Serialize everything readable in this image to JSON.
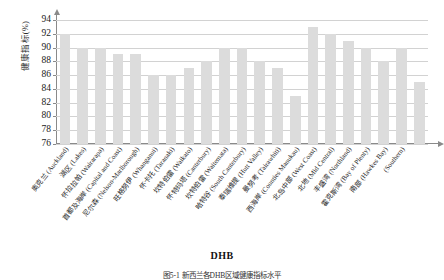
{
  "figure": {
    "axis_title_x": "DHB",
    "axis_title_y": "健康指标(%)",
    "caption": "图5-1  新西兰各DHB区域健康指标水平"
  },
  "chart_data": {
    "type": "bar",
    "title": "",
    "xlabel": "DHB",
    "ylabel": "健康指标(%)",
    "ylim": [
      76,
      94
    ],
    "ytick_step": 2,
    "ytick_labels": [
      "76",
      "78",
      "80",
      "82",
      "84",
      "86",
      "88",
      "90",
      "92",
      "94"
    ],
    "grid": true,
    "legend": "none",
    "bar_color": "#dcdcdc",
    "categories": [
      "奥克兰（Auckland）",
      "湖区（Lakes）",
      "怀拉拉帕（Wairarapa）",
      "首都及海岸（Capital and Coast）",
      "尼尔森-马尔堡（Nelson-Marlborough）",
      "旺格努伊（Whanganui）",
      "怀卡托（Waikato）",
      "坎特伯雷（Canterbury）",
      "怀特玛塔（Waitemata）",
      "南坎特伯雷（South Canterbury）",
      "哈特谷（Hutt Valley）",
      "泰瑞维提（Tairawhiti）",
      "曼努考（Counties Manukau）",
      "西海岸（West Coast）",
      "北岛中部（Mid Central）",
      "北地（Northland）",
      "丰盛湾（Bay of Plenty）",
      "霍克斯湾（Hawkes Bay）",
      "南部（Southern）",
      "塔拉纳基（Taranaki）",
      "其他"
    ],
    "categories_display": [
      "奥克兰（Auckland）",
      "湖区（Lakes）",
      "怀拉拉帕（Wairarapa）",
      "首都及海岸（Capital and Coast）",
      "尼尔森（Nelson-Marlborough）",
      "旺格努伊（Whanganui）",
      "怀卡托（Taranaki）",
      "坎特伯雷（Waikato）",
      "怀特玛塔（Canterbury）",
      "坎特伯雷（Waitemata）",
      "哈特谷（South Canterbury）",
      "泰瑞维提（Hutt Valley）",
      "曼努考（Tairawhiti）",
      "西海岸（Counties Manukau）",
      "北岛中部（West Coast）",
      "北地（Mid Central）",
      "丰盛湾（Northland）",
      "霍克斯湾（Bay of Plenty）",
      "南部（Hawkes Bay）",
      "（Southern）",
      ""
    ],
    "values": [
      92,
      90,
      90,
      89,
      89,
      86,
      86,
      87,
      88,
      90,
      90,
      88,
      87,
      83,
      93,
      92,
      91,
      90,
      88,
      90,
      85
    ],
    "values_display": [
      "92",
      "90",
      "90",
      "89",
      "89",
      "86",
      "86",
      "87",
      "88",
      "90",
      "90",
      "88",
      "87",
      "83",
      "93",
      "92",
      "91",
      "90",
      "88",
      "90",
      "85"
    ]
  },
  "labels": [
    {
      "cn": "奥克兰",
      "en": "(Auckland)"
    },
    {
      "cn": "湖区",
      "en": "(Lakes)"
    },
    {
      "cn": "怀拉拉帕",
      "en": "(Wairarapa)"
    },
    {
      "cn": "首都及海岸",
      "en": "(Capital and Coast)"
    },
    {
      "cn": "尼尔森",
      "en": "(Nelson-Marlborough)"
    },
    {
      "cn": "旺格努伊",
      "en": "(Whanganui)"
    },
    {
      "cn": "怀卡托",
      "en": "(Taranaki)"
    },
    {
      "cn": "坎特伯雷",
      "en": "(Waikato)"
    },
    {
      "cn": "怀特玛塔",
      "en": "(Canterbury)"
    },
    {
      "cn": "坎特伯雷",
      "en": "(Waitemata)"
    },
    {
      "cn": "哈特谷",
      "en": "(South Canterbury)"
    },
    {
      "cn": "泰瑞维提",
      "en": "(Hutt Valley)"
    },
    {
      "cn": "曼努考",
      "en": "(Tairawhiti)"
    },
    {
      "cn": "西海岸",
      "en": "(Counties Manukau)"
    },
    {
      "cn": "北岛中部",
      "en": "(West Coast)"
    },
    {
      "cn": "北地",
      "en": "(Mid Central)"
    },
    {
      "cn": "丰盛湾",
      "en": "(Northland)"
    },
    {
      "cn": "霍克斯湾",
      "en": "(Bay of Plenty)"
    },
    {
      "cn": "南部",
      "en": "(Hawkes Bay)"
    },
    {
      "cn": "",
      "en": "(Southern)"
    },
    {
      "cn": "",
      "en": ""
    }
  ]
}
